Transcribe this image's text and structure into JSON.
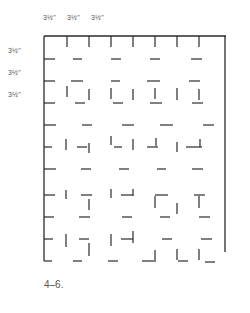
{
  "figure": {
    "caption": "4–6.",
    "top_labels": [
      {
        "text": "3½\"",
        "x": 43
      },
      {
        "text": "3½\"",
        "x": 67
      },
      {
        "text": "3½\"",
        "x": 91
      }
    ],
    "side_labels": [
      {
        "text": "3½\"",
        "y": 51
      },
      {
        "text": "3½\"",
        "y": 73
      },
      {
        "text": "3½\"",
        "y": 95
      }
    ],
    "stroke_color": "#2a2a2a",
    "frame": {
      "top": [
        [
          44,
          36
        ],
        [
          226,
          36
        ]
      ],
      "left": [
        [
          44,
          36
        ],
        [
          44,
          261
        ]
      ],
      "right": [
        [
          225,
          36
        ],
        [
          225,
          252
        ]
      ]
    },
    "segments": [
      [
        67,
        36,
        67,
        47
      ],
      [
        89,
        36,
        89,
        47
      ],
      [
        111,
        36,
        111,
        47
      ],
      [
        133,
        36,
        133,
        47
      ],
      [
        155,
        36,
        155,
        47
      ],
      [
        177,
        36,
        177,
        47
      ],
      [
        199,
        36,
        199,
        47
      ],
      [
        44,
        59,
        55,
        59
      ],
      [
        73,
        59,
        82,
        59
      ],
      [
        111,
        59,
        121,
        59
      ],
      [
        150,
        59,
        160,
        59
      ],
      [
        191,
        59,
        202,
        59
      ],
      [
        44,
        81,
        55,
        81
      ],
      [
        71,
        81,
        83,
        81
      ],
      [
        111,
        81,
        120,
        81
      ],
      [
        147,
        81,
        160,
        81
      ],
      [
        189,
        81,
        200,
        81
      ],
      [
        67,
        86,
        67,
        97
      ],
      [
        89,
        89,
        89,
        100
      ],
      [
        111,
        88,
        111,
        99
      ],
      [
        133,
        89,
        133,
        100
      ],
      [
        155,
        88,
        155,
        99
      ],
      [
        177,
        88,
        177,
        100
      ],
      [
        199,
        89,
        199,
        100
      ],
      [
        44,
        103,
        55,
        103
      ],
      [
        75,
        103,
        85,
        103
      ],
      [
        113,
        103,
        123,
        103
      ],
      [
        150,
        103,
        162,
        103
      ],
      [
        192,
        103,
        203,
        103
      ],
      [
        44,
        125,
        56,
        125
      ],
      [
        82,
        125,
        92,
        125
      ],
      [
        122,
        125,
        134,
        125
      ],
      [
        160,
        125,
        173,
        125
      ],
      [
        203,
        125,
        214,
        125
      ],
      [
        44,
        147,
        52,
        147
      ],
      [
        77,
        147,
        87,
        147
      ],
      [
        114,
        147,
        122,
        147
      ],
      [
        147,
        147,
        158,
        147
      ],
      [
        186,
        147,
        202,
        147
      ],
      [
        66,
        139,
        66,
        150
      ],
      [
        89,
        143,
        89,
        153
      ],
      [
        111,
        136,
        111,
        145
      ],
      [
        133,
        139,
        133,
        150
      ],
      [
        156,
        138,
        156,
        146
      ],
      [
        177,
        142,
        177,
        152
      ],
      [
        200,
        139,
        200,
        147
      ],
      [
        44,
        169,
        56,
        169
      ],
      [
        81,
        169,
        91,
        169
      ],
      [
        119,
        169,
        129,
        169
      ],
      [
        157,
        169,
        166,
        169
      ],
      [
        192,
        169,
        203,
        169
      ],
      [
        44,
        195,
        55,
        195
      ],
      [
        81,
        195,
        92,
        195
      ],
      [
        121,
        195,
        133,
        195
      ],
      [
        155,
        195,
        168,
        195
      ],
      [
        194,
        195,
        205,
        195
      ],
      [
        66,
        190,
        66,
        199
      ],
      [
        89,
        199,
        89,
        210
      ],
      [
        111,
        189,
        111,
        198
      ],
      [
        133,
        189,
        133,
        196
      ],
      [
        155,
        196,
        155,
        208
      ],
      [
        177,
        203,
        177,
        214
      ],
      [
        199,
        196,
        199,
        208
      ],
      [
        44,
        217,
        54,
        217
      ],
      [
        79,
        217,
        90,
        217
      ],
      [
        122,
        217,
        132,
        217
      ],
      [
        160,
        217,
        170,
        217
      ],
      [
        199,
        217,
        210,
        217
      ],
      [
        44,
        239,
        53,
        239
      ],
      [
        79,
        239,
        89,
        239
      ],
      [
        121,
        239,
        133,
        239
      ],
      [
        162,
        239,
        172,
        239
      ],
      [
        201,
        239,
        212,
        239
      ],
      [
        66,
        234,
        66,
        247
      ],
      [
        89,
        243,
        89,
        256
      ],
      [
        111,
        234,
        111,
        246
      ],
      [
        133,
        231,
        133,
        243
      ],
      [
        155,
        250,
        155,
        262
      ],
      [
        177,
        249,
        177,
        260
      ],
      [
        199,
        249,
        199,
        260
      ],
      [
        44,
        261,
        52,
        261
      ],
      [
        73,
        261,
        82,
        261
      ],
      [
        108,
        261,
        118,
        261
      ],
      [
        142,
        261,
        154,
        261
      ],
      [
        178,
        261,
        188,
        261
      ],
      [
        205,
        262,
        215,
        262
      ]
    ]
  }
}
